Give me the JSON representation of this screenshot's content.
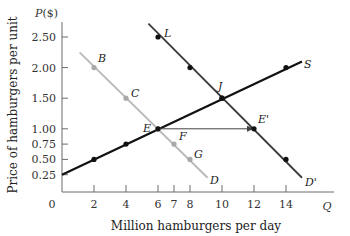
{
  "chart_data": {
    "type": "line",
    "title": "",
    "xlabel": "Million hamburgers per day",
    "ylabel": "Price of hamburgers per unit",
    "x_axis_symbol": "Q",
    "y_axis_symbol": "P($)",
    "origin_label": "0",
    "x_ticks": [
      2,
      4,
      6,
      7,
      8,
      10,
      12,
      14
    ],
    "y_ticks": [
      0.25,
      0.5,
      0.75,
      1.0,
      1.5,
      2.0,
      2.5
    ],
    "y_tick_labels": [
      "0.25",
      "0.50",
      "0.75",
      "1.00",
      "1.50",
      "2.00",
      "2.50"
    ],
    "xlim": [
      0,
      17
    ],
    "ylim": [
      0,
      2.75
    ],
    "grid": false,
    "legend": "none (curves labeled inline)",
    "series": [
      {
        "name": "D",
        "label": "D",
        "color": "#b8b8b8",
        "line": [
          [
            1.1,
            2.25
          ],
          [
            9.1,
            0.2
          ]
        ],
        "points": [
          {
            "label": "B",
            "x": 2,
            "y": 2.0
          },
          {
            "label": "C",
            "x": 4,
            "y": 1.5
          },
          {
            "label": "E",
            "x": 6,
            "y": 1.0
          },
          {
            "label": "F",
            "x": 7,
            "y": 0.75
          },
          {
            "label": "G",
            "x": 8,
            "y": 0.5
          }
        ]
      },
      {
        "name": "D'",
        "label": "D'",
        "color": "#3a3a3a",
        "line": [
          [
            5.4,
            2.72
          ],
          [
            15,
            0.2
          ]
        ],
        "points": [
          {
            "label": "L",
            "x": 6,
            "y": 2.5
          },
          {
            "label": "",
            "x": 8,
            "y": 2.0
          },
          {
            "label": "J",
            "x": 10,
            "y": 1.5
          },
          {
            "label": "E'",
            "x": 12,
            "y": 1.0
          },
          {
            "label": "",
            "x": 14,
            "y": 0.5
          }
        ]
      },
      {
        "name": "S",
        "label": "S",
        "color": "#111111",
        "line": [
          [
            0,
            0.25
          ],
          [
            15,
            2.1
          ]
        ],
        "points": [
          {
            "label": "",
            "x": 2,
            "y": 0.5
          },
          {
            "label": "",
            "x": 4,
            "y": 0.75
          },
          {
            "label": "E",
            "x": 6,
            "y": 1.0
          },
          {
            "label": "J",
            "x": 10,
            "y": 1.5
          },
          {
            "label": "",
            "x": 14,
            "y": 2.0
          }
        ]
      }
    ],
    "annotations": [
      {
        "type": "arrow",
        "from": [
          6,
          1.0
        ],
        "to": [
          12,
          1.0
        ],
        "description": "horizontal shift arrow from E to E'"
      }
    ]
  }
}
